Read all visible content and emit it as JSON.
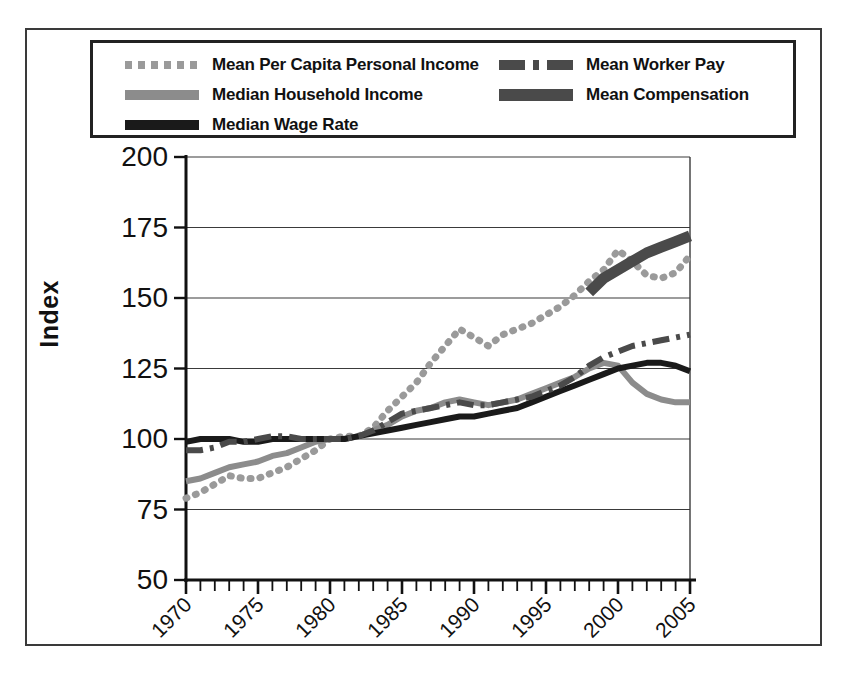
{
  "figure": {
    "ylabel": "Index",
    "legend": [
      {
        "label": "Mean Per Capita Personal Income",
        "style": "dotted",
        "color": "#9a9a9a",
        "column": 1
      },
      {
        "label": "Median Household Income",
        "style": "solid",
        "color": "#8c8c8c",
        "column": 1
      },
      {
        "label": "Median Wage Rate",
        "style": "solid",
        "color": "#1a1a1a",
        "column": 1
      },
      {
        "label": "Mean Worker Pay",
        "style": "dashdot",
        "color": "#4a4a4a",
        "column": 2
      },
      {
        "label": "Mean Compensation",
        "style": "solid-thick",
        "color": "#4a4a4a",
        "column": 2
      }
    ]
  },
  "chart_data": {
    "type": "line",
    "title": "",
    "xlabel": "",
    "ylabel": "Index",
    "xlim": [
      1970,
      2005
    ],
    "ylim": [
      50,
      200
    ],
    "yticks": [
      50,
      75,
      100,
      125,
      150,
      175,
      200
    ],
    "xticks": [
      1970,
      1975,
      1980,
      1985,
      1990,
      1995,
      2000,
      2005
    ],
    "x_minor_tick_step": 1,
    "grid": "horizontal",
    "legend_position": "above-plot",
    "base_year": 1980,
    "base_value": 100,
    "series": [
      {
        "name": "Mean Per Capita Personal Income",
        "style": "dotted",
        "color": "#9a9a9a",
        "x": [
          1970,
          1971,
          1972,
          1973,
          1974,
          1975,
          1976,
          1977,
          1978,
          1979,
          1980,
          1981,
          1982,
          1983,
          1984,
          1985,
          1986,
          1987,
          1988,
          1989,
          1990,
          1991,
          1992,
          1993,
          1994,
          1995,
          1996,
          1997,
          1998,
          1999,
          2000,
          2001,
          2002,
          2003,
          2004,
          2005
        ],
        "values": [
          79,
          81,
          84,
          87,
          86,
          86,
          88,
          90,
          93,
          96,
          100,
          101,
          101,
          104,
          110,
          115,
          120,
          127,
          133,
          139,
          136,
          133,
          137,
          139,
          141,
          144,
          147,
          151,
          156,
          160,
          167,
          163,
          158,
          157,
          159,
          165
        ]
      },
      {
        "name": "Median Household Income",
        "style": "solid",
        "color": "#8c8c8c",
        "x": [
          1970,
          1971,
          1972,
          1973,
          1974,
          1975,
          1976,
          1977,
          1978,
          1979,
          1980,
          1981,
          1982,
          1983,
          1984,
          1985,
          1986,
          1987,
          1988,
          1989,
          1990,
          1991,
          1992,
          1993,
          1994,
          1995,
          1996,
          1997,
          1998,
          1999,
          2000,
          2001,
          2002,
          2003,
          2004,
          2005
        ],
        "values": [
          85,
          86,
          88,
          90,
          91,
          92,
          94,
          95,
          97,
          99,
          100,
          100,
          101,
          103,
          105,
          108,
          110,
          111,
          113,
          114,
          113,
          112,
          113,
          114,
          116,
          118,
          120,
          122,
          125,
          127,
          126,
          120,
          116,
          114,
          113,
          113
        ]
      },
      {
        "name": "Median Wage Rate",
        "style": "solid",
        "color": "#1a1a1a",
        "x": [
          1970,
          1971,
          1972,
          1973,
          1974,
          1975,
          1976,
          1977,
          1978,
          1979,
          1980,
          1981,
          1982,
          1983,
          1984,
          1985,
          1986,
          1987,
          1988,
          1989,
          1990,
          1991,
          1992,
          1993,
          1994,
          1995,
          1996,
          1997,
          1998,
          1999,
          2000,
          2001,
          2002,
          2003,
          2004,
          2005
        ],
        "values": [
          99,
          100,
          100,
          100,
          99,
          99,
          100,
          100,
          100,
          100,
          100,
          100,
          101,
          102,
          103,
          104,
          105,
          106,
          107,
          108,
          108,
          109,
          110,
          111,
          113,
          115,
          117,
          119,
          121,
          123,
          125,
          126,
          127,
          127,
          126,
          124
        ]
      },
      {
        "name": "Mean Worker Pay",
        "style": "dashdot",
        "color": "#4a4a4a",
        "x": [
          1970,
          1971,
          1972,
          1973,
          1974,
          1975,
          1976,
          1977,
          1978,
          1979,
          1980,
          1981,
          1982,
          1983,
          1984,
          1985,
          1986,
          1987,
          1988,
          1989,
          1990,
          1991,
          1992,
          1993,
          1994,
          1995,
          1996,
          1997,
          1998,
          1999,
          2000,
          2001,
          2002,
          2003,
          2004,
          2005
        ],
        "values": [
          96,
          96,
          97,
          99,
          99,
          100,
          101,
          101,
          100,
          100,
          100,
          100,
          101,
          103,
          106,
          109,
          110,
          111,
          112,
          113,
          112,
          112,
          113,
          114,
          115,
          117,
          119,
          122,
          126,
          129,
          131,
          133,
          134,
          135,
          136,
          137
        ]
      },
      {
        "name": "Mean Compensation",
        "style": "solid-thick",
        "color": "#4a4a4a",
        "x": [
          1998,
          1999,
          2000,
          2001,
          2002,
          2003,
          2004,
          2005
        ],
        "values": [
          152,
          157,
          160,
          163,
          166,
          168,
          170,
          172
        ]
      }
    ]
  }
}
